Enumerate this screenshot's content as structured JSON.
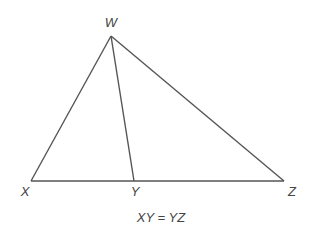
{
  "diagram": {
    "stroke_color": "#555555",
    "label_color": "#444444",
    "vertices": {
      "W": {
        "label": "W",
        "x": 111,
        "y": 36
      },
      "X": {
        "label": "X",
        "x": 31,
        "y": 181
      },
      "Y": {
        "label": "Y",
        "x": 134,
        "y": 181
      },
      "Z": {
        "label": "Z",
        "x": 284,
        "y": 181
      }
    },
    "segments": [
      [
        "W",
        "X"
      ],
      [
        "W",
        "Z"
      ],
      [
        "X",
        "Z"
      ],
      [
        "W",
        "Y"
      ]
    ],
    "caption": "XY = YZ"
  }
}
